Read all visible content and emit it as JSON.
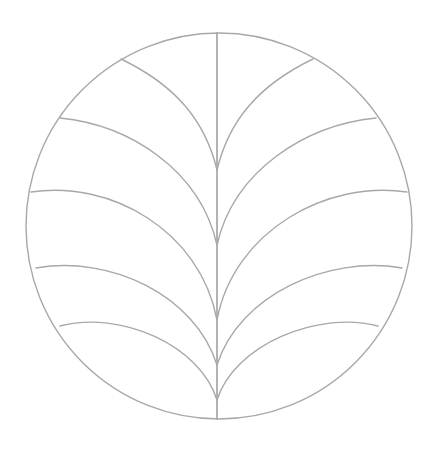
{
  "figure": {
    "stroke_color": "#a8a8a8",
    "background": "#ffffff",
    "circle": {
      "cx": 219,
      "cy": 226,
      "r": 193
    },
    "stem": {
      "x": 217,
      "y1": 33,
      "y2": 419
    },
    "fronds": [
      {
        "side": "left",
        "start": [
          121,
          59
        ],
        "end": [
          217,
          170
        ]
      },
      {
        "side": "left",
        "start": [
          60,
          118
        ],
        "end": [
          217,
          245
        ]
      },
      {
        "side": "left",
        "start": [
          31,
          192
        ],
        "end": [
          217,
          320
        ]
      },
      {
        "side": "left",
        "start": [
          36,
          268
        ],
        "end": [
          217,
          365
        ]
      },
      {
        "side": "left",
        "start": [
          60,
          326
        ],
        "end": [
          217,
          400
        ]
      },
      {
        "side": "right",
        "start": [
          313,
          59
        ],
        "end": [
          217,
          170
        ]
      },
      {
        "side": "right",
        "start": [
          376,
          118
        ],
        "end": [
          217,
          245
        ]
      },
      {
        "side": "right",
        "start": [
          407,
          192
        ],
        "end": [
          217,
          320
        ]
      },
      {
        "side": "right",
        "start": [
          402,
          268
        ],
        "end": [
          217,
          365
        ]
      },
      {
        "side": "right",
        "start": [
          378,
          326
        ],
        "end": [
          217,
          400
        ]
      }
    ]
  }
}
